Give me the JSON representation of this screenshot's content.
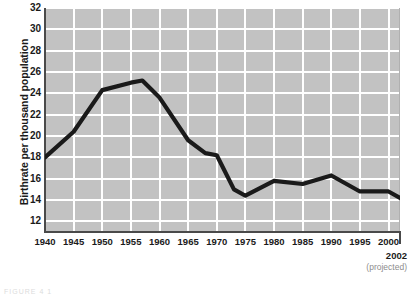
{
  "chart_data": {
    "type": "line",
    "title": "",
    "xlabel": "",
    "ylabel": "Birthrate per thousand population",
    "xlim": [
      1940,
      2002
    ],
    "ylim": [
      11,
      32
    ],
    "grid": true,
    "legend": null,
    "x": [
      1940,
      1945,
      1950,
      1955,
      1957,
      1960,
      1965,
      1968,
      1970,
      1973,
      1975,
      1980,
      1985,
      1990,
      1995,
      2000,
      2002
    ],
    "values": [
      18.0,
      20.4,
      24.3,
      25.0,
      25.2,
      23.6,
      19.6,
      18.4,
      18.2,
      15.0,
      14.4,
      15.8,
      15.5,
      16.3,
      14.8,
      14.8,
      14.2
    ],
    "series": [
      {
        "name": "Birthrate",
        "color": "#1a1a1a",
        "values": [
          18.0,
          20.4,
          24.3,
          25.0,
          25.2,
          23.6,
          19.6,
          18.4,
          18.2,
          15.0,
          14.4,
          15.8,
          15.5,
          16.3,
          14.8,
          14.8,
          14.2
        ]
      }
    ],
    "y_ticks": [
      12,
      14,
      16,
      18,
      20,
      22,
      24,
      26,
      28,
      30,
      32
    ],
    "x_ticks": [
      "1940",
      "1945",
      "1950",
      "1955",
      "1960",
      "1965",
      "1970",
      "1975",
      "1980",
      "1985",
      "1990",
      "1995",
      "2000"
    ],
    "x_tick_values": [
      1940,
      1945,
      1950,
      1955,
      1960,
      1965,
      1970,
      1975,
      1980,
      1985,
      1990,
      1995,
      2000
    ],
    "annotations": {
      "projected_year": "2002",
      "projected_note": "(projected)"
    },
    "colors": {
      "plot_background": "#c2c2c2",
      "gridline": "#ffffff",
      "line": "#1a1a1a",
      "axis": "#4a4a4a",
      "tick_label": "#1a1a1a",
      "note": "#8d8d8d"
    }
  },
  "footer": {
    "text": "FIGURE 4 1"
  }
}
